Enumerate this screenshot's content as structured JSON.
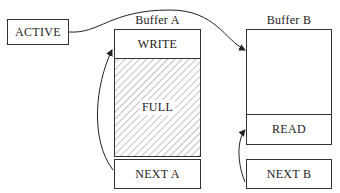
{
  "diagram": {
    "type": "double-buffering",
    "active_pointer": {
      "label": "ACTIVE"
    },
    "buffers": [
      {
        "title": "Buffer A",
        "top_section": "WRITE",
        "fill_section": "FULL",
        "next_pointer": "NEXT A"
      },
      {
        "title": "Buffer B",
        "bottom_section": "READ",
        "next_pointer": "NEXT B"
      }
    ],
    "colors": {
      "line": "#333333",
      "hatch": "#555555",
      "background": "#ffffff"
    }
  }
}
